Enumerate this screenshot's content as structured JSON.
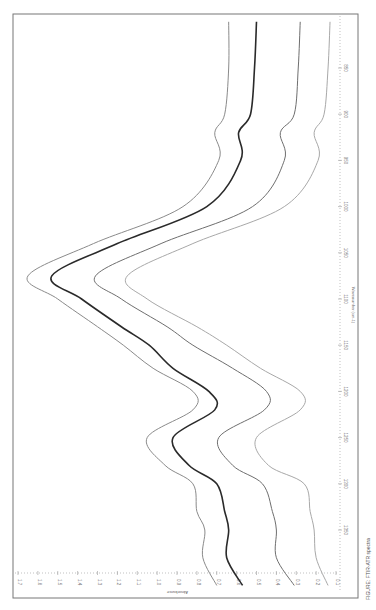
{
  "chart_data": {
    "type": "line",
    "orientation": "rotated 90 degrees clockwise (x-axis runs top-to-bottom along right edge, y-axis along bottom edge, values increase leftward)",
    "title": "",
    "xlabel": "Wavenumber (cm-1)",
    "ylabel": "Absorbance",
    "xlim": [
      790,
      1415
    ],
    "ylim": [
      0.1,
      1.7
    ],
    "x_ticks": [
      850,
      900,
      950,
      1000,
      1050,
      1100,
      1150,
      1200,
      1250,
      1300,
      1350
    ],
    "y_ticks": [
      1.7,
      1.6,
      1.5,
      1.4,
      1.3,
      1.2,
      1.1,
      1.0,
      0.9,
      0.8,
      0.7,
      0.6,
      0.5,
      0.4,
      0.3,
      0.2,
      0.1
    ],
    "grid": false,
    "legend": null,
    "x": [
      800,
      850,
      900,
      920,
      950,
      1000,
      1040,
      1075,
      1100,
      1130,
      1150,
      1175,
      1200,
      1220,
      1250,
      1280,
      1300,
      1330,
      1350,
      1380,
      1410
    ],
    "series": [
      {
        "name": "Spectrum 1",
        "color": "#8a8a8a",
        "values": [
          0.64,
          0.64,
          0.66,
          0.71,
          0.69,
          0.87,
          1.32,
          1.65,
          1.5,
          1.3,
          1.17,
          1.02,
          0.82,
          0.82,
          1.05,
          0.96,
          0.82,
          0.8,
          0.76,
          0.77,
          0.7
        ]
      },
      {
        "name": "Spectrum 2",
        "color": "#2a2a2a",
        "values": [
          0.5,
          0.51,
          0.53,
          0.59,
          0.58,
          0.75,
          1.2,
          1.53,
          1.38,
          1.18,
          1.04,
          0.92,
          0.74,
          0.71,
          0.92,
          0.84,
          0.7,
          0.66,
          0.64,
          0.65,
          0.57
        ]
      },
      {
        "name": "Spectrum 3",
        "color": "#6e6e6e",
        "values": [
          0.28,
          0.29,
          0.31,
          0.38,
          0.36,
          0.52,
          0.98,
          1.31,
          1.18,
          0.95,
          0.82,
          0.62,
          0.45,
          0.46,
          0.69,
          0.62,
          0.47,
          0.42,
          0.4,
          0.4,
          0.31
        ]
      },
      {
        "name": "Spectrum 4",
        "color": "#a8a8a8",
        "values": [
          0.13,
          0.14,
          0.16,
          0.21,
          0.19,
          0.36,
          0.82,
          1.15,
          1.05,
          0.8,
          0.65,
          0.48,
          0.28,
          0.28,
          0.5,
          0.44,
          0.26,
          0.23,
          0.21,
          0.2,
          0.14
        ]
      }
    ]
  },
  "axes": {
    "x_title": "Wavenumber (cm-1)",
    "y_title": "Absorbance",
    "x_tick_labels": [
      "850",
      "900",
      "950",
      "1000",
      "1050",
      "1100",
      "1150",
      "1200",
      "1250",
      "1300",
      "1350"
    ],
    "y_tick_labels": [
      "1.7",
      "1.6",
      "1.5",
      "1.4",
      "1.3",
      "1.2",
      "1.1",
      "1.0",
      "0.9",
      "0.8",
      "0.7",
      "0.6",
      "0.5",
      "0.4",
      "0.3",
      "0.2",
      "0.1"
    ]
  },
  "caption": {
    "text": "FIGURE: FTIR-ATR spectra"
  }
}
